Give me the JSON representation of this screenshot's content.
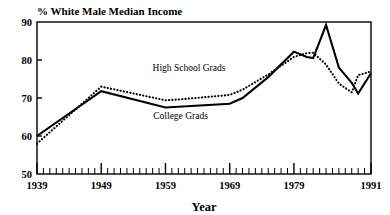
{
  "chart_data": {
    "type": "line",
    "title": "% White Male Median Income",
    "xlabel": "Year",
    "ylabel": "",
    "xlim": [
      1939,
      1991
    ],
    "ylim": [
      50,
      90
    ],
    "grid": false,
    "legend_position": "inline-annotation",
    "y_ticks": [
      50,
      60,
      70,
      80,
      90
    ],
    "x_ticks": [
      1939,
      1949,
      1959,
      1969,
      1979,
      1991
    ],
    "x_minor_tick_step": 1,
    "x": [
      1939,
      1949,
      1959,
      1961,
      1969,
      1971,
      1975,
      1979,
      1981,
      1982,
      1984,
      1986,
      1988,
      1989,
      1991
    ],
    "series": [
      {
        "name": "College Grads",
        "style": "solid",
        "values": [
          60.0,
          71.8,
          67.5,
          67.7,
          68.5,
          70.0,
          75.5,
          82.2,
          80.8,
          80.5,
          89.2,
          78.0,
          74.0,
          71.2,
          76.5
        ]
      },
      {
        "name": "High School Grads",
        "style": "dotted",
        "values": [
          58.0,
          73.0,
          69.4,
          69.6,
          70.8,
          72.2,
          76.2,
          80.8,
          81.8,
          81.9,
          78.8,
          73.8,
          71.5,
          76.0,
          77.0
        ]
      }
    ],
    "annotations": [
      {
        "text": "High School Grads",
        "x_pct": 45.5,
        "y_pct": 32.0
      },
      {
        "text": "College Grads",
        "x_pct": 43.0,
        "y_pct": 63.5
      }
    ]
  },
  "colors": {
    "ink": "#000000",
    "background": "#ffffff"
  }
}
